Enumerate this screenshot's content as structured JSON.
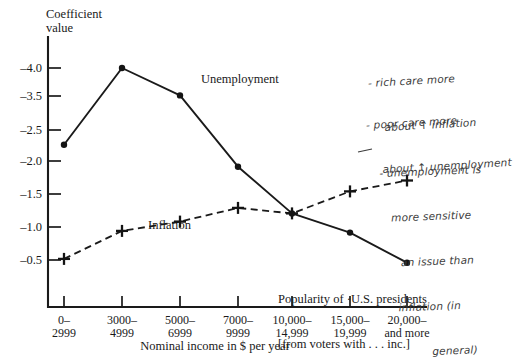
{
  "axes": {
    "y_title_line1": "Coefficient",
    "y_title_line2": "value",
    "x_title": "Nominal income in $ per year",
    "y_ticks": [
      "–4.0",
      "–3.5",
      "–2.5",
      "–2.0",
      "–1.5",
      "–1.0",
      "–0.5"
    ],
    "x_ticks": [
      {
        "line1": "0–",
        "line2": "2999"
      },
      {
        "line1": "3000–",
        "line2": "4999"
      },
      {
        "line1": "5000–",
        "line2": "6999"
      },
      {
        "line1": "7000–",
        "line2": "9999"
      },
      {
        "line1": "10,000–",
        "line2": "14,999"
      },
      {
        "line1": "15,000–",
        "line2": "19,999"
      },
      {
        "line1": "20,000–",
        "line2": "and more"
      }
    ]
  },
  "series_labels": {
    "unemployment": "Unemployment",
    "inflation": "Inflation"
  },
  "caption": {
    "line1": "Popularity of ·U.S. presidents",
    "line2": "[from voters with . . . inc.]"
  },
  "annotations": [
    {
      "id": "hand-rich",
      "line1": "- rich care more",
      "line2": "about ↑ inflation"
    },
    {
      "id": "hand-poor",
      "line1": "- poor care more",
      "line2": "about ↑ unemployment"
    },
    {
      "id": "hand-sens",
      "line1": "- unemployment is",
      "line2": "more sensitive",
      "line3": "an issue than",
      "line4": "inflation (in",
      "line5": "general)"
    }
  ],
  "colors": {
    "ink": "#1a1a1a",
    "pencil": "#3b3b3b",
    "background": "#ffffff"
  },
  "chart_data": {
    "type": "line",
    "xlabel": "Nominal income in $ per year",
    "ylabel": "Coefficient value",
    "grid": false,
    "legend": "inline-labels",
    "categories": [
      "0-2999",
      "3000-4999",
      "5000-6999",
      "7000-9999",
      "10,000-14,999",
      "15,000-19,999",
      "20,000-and more"
    ],
    "ylim": [
      -4.25,
      -0.25
    ],
    "yticks": [
      -4.0,
      -3.5,
      -2.5,
      -2.0,
      -1.5,
      -1.0,
      -0.5
    ],
    "series": [
      {
        "name": "Unemployment",
        "style": "solid",
        "marker": "filled-circle",
        "values": [
          -2.6,
          -4.0,
          -3.5,
          -2.2,
          -1.35,
          -1.0,
          -0.45
        ]
      },
      {
        "name": "Inflation",
        "style": "dashed",
        "marker": "plus",
        "values": [
          -0.52,
          -1.03,
          -1.2,
          -1.45,
          -1.35,
          -1.75,
          -1.95
        ]
      }
    ]
  }
}
